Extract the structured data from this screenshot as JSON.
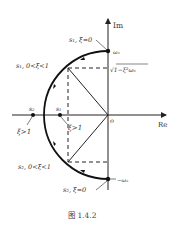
{
  "diagram": {
    "axes": {
      "imag_label": "Im",
      "real_label": "Re",
      "origin_label": "o"
    },
    "labels": {
      "s1_zeta0": "s₁, ξ=0",
      "s1_underdamped": "s₁, 0<ξ<1",
      "s2_underdamped": "s₂, 0<ξ<1",
      "s2_zeta0": "s₂, ξ=0",
      "omega_n": "ωₙ",
      "neg_omega_n": "−ωₙ",
      "damped_freq": "√1−ξ²ωₙ",
      "s2_real": "s₂",
      "s1_real": "s₁",
      "overdamped_left": "ξ>1",
      "overdamped_right": "ξ>1"
    },
    "colors": {
      "line": "#222222",
      "text": "#333333"
    }
  },
  "caption": "图 1.4.2"
}
